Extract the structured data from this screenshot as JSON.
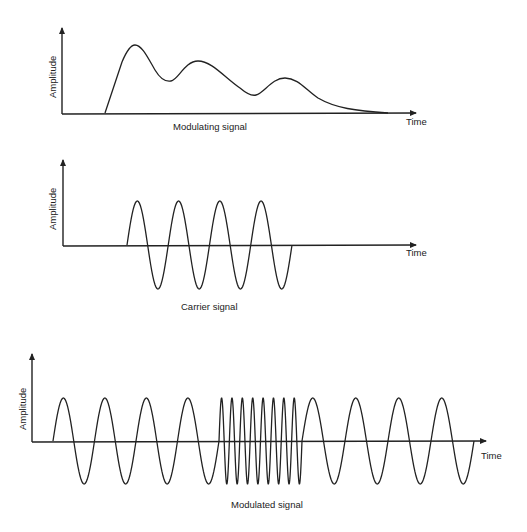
{
  "panels": [
    {
      "id": "modulating",
      "caption": "Modulating signal",
      "y_label": "Amplitude",
      "x_label": "Time"
    },
    {
      "id": "carrier",
      "caption": "Carrier signal",
      "y_label": "Amplitude",
      "x_label": "Time"
    },
    {
      "id": "modulated",
      "caption": "Modulated signal",
      "y_label": "Amplitude",
      "x_label": "Time"
    }
  ],
  "colors": {
    "line": "#222222",
    "background": "#ffffff"
  }
}
